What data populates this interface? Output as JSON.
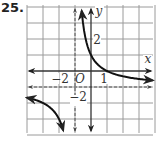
{
  "problem_number": "25.",
  "colors": {
    "grid": "#9a9a9a",
    "axis": "#333333",
    "curve": "#111111",
    "asymptote": "#555555"
  },
  "chart_data": {
    "type": "line",
    "title": "",
    "function": "y = 2/(x+1) - 1",
    "xlabel": "x",
    "ylabel": "y",
    "origin_label": "O",
    "xlim": [
      -4,
      4
    ],
    "ylim": [
      -4,
      4
    ],
    "grid": true,
    "tick_labels": {
      "x": [
        {
          "value": -2,
          "text": "−2"
        },
        {
          "value": 1,
          "text": "1"
        }
      ],
      "y": [
        {
          "value": 2,
          "text": "2"
        },
        {
          "value": -2,
          "text": "−2"
        }
      ]
    },
    "asymptotes": {
      "vertical": {
        "x": -1,
        "style": "dashed"
      },
      "horizontal": {
        "y": -1,
        "style": "dashed"
      }
    },
    "series": [
      {
        "name": "right-branch",
        "points": [
          [
            -0.6,
            4.0
          ],
          [
            -0.5,
            3.0
          ],
          [
            -0.33,
            2.0
          ],
          [
            0,
            1.0
          ],
          [
            0.5,
            0.33
          ],
          [
            1,
            0
          ],
          [
            2,
            -0.33
          ],
          [
            3,
            -0.5
          ],
          [
            4,
            -0.6
          ]
        ]
      },
      {
        "name": "left-branch",
        "points": [
          [
            -4,
            -1.67
          ],
          [
            -3,
            -2.0
          ],
          [
            -2.5,
            -2.33
          ],
          [
            -2,
            -3.0
          ],
          [
            -1.75,
            -3.67
          ]
        ]
      }
    ]
  }
}
